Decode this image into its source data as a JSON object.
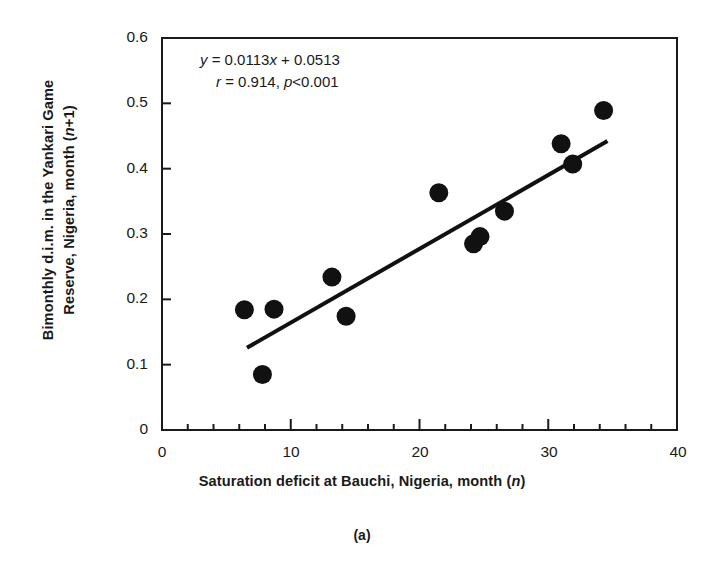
{
  "chart_data": {
    "type": "scatter",
    "title": "",
    "subtitle": "",
    "caption": "(a)",
    "xlabel": "Saturation deficit at Bauchi, Nigeria, month (n)",
    "ylabel_line1": "Bimonthly d.i.m. in the Yankari Game",
    "ylabel_line2": "Reserve, Nigeria, month (n+1)",
    "xlim": [
      0,
      40
    ],
    "ylim": [
      0,
      0.6
    ],
    "xticks": [
      0,
      10,
      20,
      30,
      40
    ],
    "xtick_labels": [
      "0",
      "10",
      "20",
      "30",
      "40"
    ],
    "yticks": [
      0,
      0.1,
      0.2,
      0.3,
      0.4,
      0.5,
      0.6
    ],
    "ytick_labels": [
      "0",
      "0.1",
      "0.2",
      "0.3",
      "0.4",
      "0.5",
      "0.6"
    ],
    "x_minor_tick_step": 2,
    "grid": false,
    "legend": "none",
    "marker": "filled-circle",
    "marker_color": "#111111",
    "marker_size_px": 19,
    "points": [
      {
        "x": 6.4,
        "y": 0.184
      },
      {
        "x": 7.8,
        "y": 0.085
      },
      {
        "x": 8.7,
        "y": 0.185
      },
      {
        "x": 13.2,
        "y": 0.234
      },
      {
        "x": 14.3,
        "y": 0.174
      },
      {
        "x": 21.5,
        "y": 0.363
      },
      {
        "x": 24.2,
        "y": 0.285
      },
      {
        "x": 24.7,
        "y": 0.296
      },
      {
        "x": 26.6,
        "y": 0.335
      },
      {
        "x": 31.0,
        "y": 0.438
      },
      {
        "x": 31.9,
        "y": 0.407
      },
      {
        "x": 34.3,
        "y": 0.489
      }
    ],
    "fit_line": {
      "slope": 0.0113,
      "intercept": 0.0513,
      "x_start": 6.6,
      "x_end": 34.6,
      "color": "#111111",
      "width_px": 4
    },
    "annotations": {
      "equation_y": "y",
      "equation_rest": " = 0.0113",
      "equation_x": "x",
      "equation_tail": " + 0.0513",
      "stat_r": "r",
      "stat_r_value": " = 0.914, ",
      "stat_p": "p",
      "stat_p_value": "<0.001"
    }
  },
  "axis": {
    "frame_color": "#1a1a1a",
    "frame_width_px": 2
  }
}
